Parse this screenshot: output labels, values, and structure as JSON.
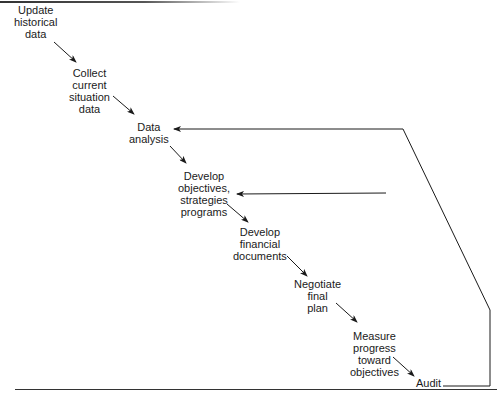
{
  "diagram": {
    "type": "sequential-process-with-feedback",
    "steps": [
      {
        "id": "update",
        "lines": [
          "Update",
          "historical",
          "data"
        ]
      },
      {
        "id": "collect",
        "lines": [
          "Collect",
          "current",
          "situation",
          "data"
        ]
      },
      {
        "id": "analysis",
        "lines": [
          "Data",
          "analysis"
        ]
      },
      {
        "id": "objectives",
        "lines": [
          "Develop",
          "objectives,",
          "strategies",
          "programs"
        ]
      },
      {
        "id": "financial",
        "lines": [
          "Develop",
          "financial",
          "documents"
        ]
      },
      {
        "id": "negotiate",
        "lines": [
          "Negotiate",
          "final",
          "plan"
        ]
      },
      {
        "id": "measure",
        "lines": [
          "Measure",
          "progress",
          "toward",
          "objectives"
        ]
      },
      {
        "id": "audit",
        "lines": [
          "Audit"
        ]
      }
    ],
    "feedback": [
      {
        "from": "audit",
        "to": "analysis"
      },
      {
        "from": "audit",
        "to": "objectives"
      }
    ],
    "stroke_color": "#1a1a1a"
  }
}
